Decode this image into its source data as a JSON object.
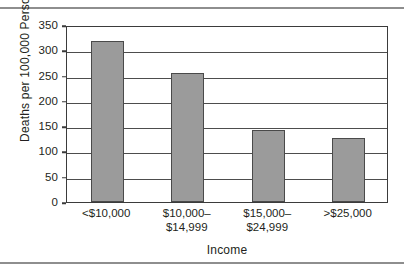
{
  "chart_data": {
    "type": "bar",
    "title": "",
    "categories": [
      "<$10,000",
      "$10,000–\n$14,999",
      "$15,000–\n$24,999",
      ">$25,000"
    ],
    "category_lines": [
      [
        "<$10,000"
      ],
      [
        "$10,000–",
        "$14,999"
      ],
      [
        "$15,000–",
        "$24,999"
      ],
      [
        ">$25,000"
      ]
    ],
    "values": [
      318,
      255,
      142,
      127
    ],
    "xlabel": "Income",
    "ylabel": "Deaths per 100,000 Persons",
    "ylim": [
      0,
      350
    ],
    "ytick_labels": [
      "0",
      "50",
      "100",
      "150",
      "200",
      "250",
      "300",
      "350"
    ],
    "ytick_values": [
      0,
      50,
      100,
      150,
      200,
      250,
      300,
      350
    ],
    "grid": "horizontal",
    "legend": "none",
    "bar_color": "#9b9b9b",
    "bar_border_color": "#4a4a4a",
    "axis_color": "#3b3b3b",
    "grid_color": "#4d4d4d",
    "text_color": "#231f20",
    "background": "#ffffff",
    "rule_color": "#8e8e8e"
  }
}
